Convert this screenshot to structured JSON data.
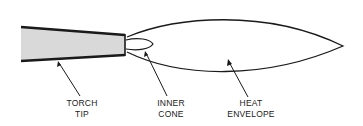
{
  "diagram": {
    "colors": {
      "stroke": "#1a1a1a",
      "torch_fill": "#d9d9d9",
      "background": "#ffffff"
    },
    "parts": [
      {
        "id": "torch-tip",
        "label_line1": "TORCH",
        "label_line2": "TIP"
      },
      {
        "id": "inner-cone",
        "label_line1": "INNER",
        "label_line2": "CONE"
      },
      {
        "id": "heat-envelope",
        "label_line1": "HEAT",
        "label_line2": "ENVELOPE"
      }
    ]
  }
}
